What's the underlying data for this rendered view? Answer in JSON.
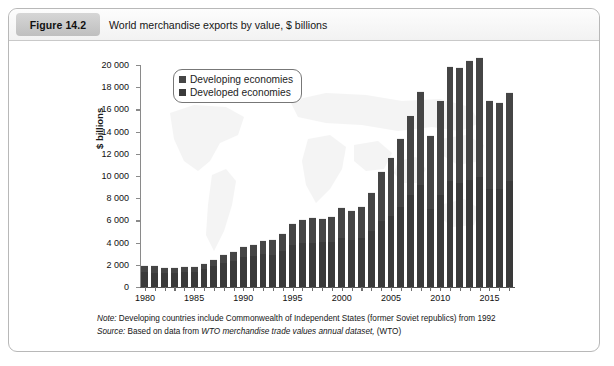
{
  "figure": {
    "badge": "Figure 14.2",
    "title": "World merchandise exports by value, $ billions"
  },
  "notes": {
    "note_key": "Note:",
    "note_text": " Developing countries include Commonwealth of Independent States (former Soviet republics) from 1992",
    "source_key": "Source:",
    "source_pre": " Based on data from ",
    "source_em": "WTO merchandise trade values annual dataset,",
    "source_post": " (WTO)"
  },
  "legend": {
    "position": "top-left-inside",
    "items": [
      {
        "label": "Developing economies",
        "color": "#454545"
      },
      {
        "label": "Developed economies",
        "color": "#3a3a3a"
      }
    ]
  },
  "chart_data": {
    "type": "bar",
    "subtype": "stacked-vertical",
    "title": "World merchandise exports by value, $ billions",
    "xlabel": "",
    "ylabel": "$ billions",
    "ylim": [
      0,
      20000
    ],
    "ytick_step": 2000,
    "ytick_labels": [
      "0",
      "2 000",
      "4 000",
      "6 000",
      "8 000",
      "10 000",
      "12 000",
      "14 000",
      "16 000",
      "18 000",
      "20 000"
    ],
    "grid": false,
    "xtick_labels_shown": [
      "1980",
      "1985",
      "1990",
      "1995",
      "2000",
      "2005",
      "2010",
      "2015"
    ],
    "categories": [
      "1980",
      "1981",
      "1982",
      "1983",
      "1984",
      "1985",
      "1986",
      "1987",
      "1988",
      "1989",
      "1990",
      "1991",
      "1992",
      "1993",
      "1994",
      "1995",
      "1996",
      "1997",
      "1998",
      "1999",
      "2000",
      "2001",
      "2002",
      "2003",
      "2004",
      "2005",
      "2006",
      "2007",
      "2008",
      "2009",
      "2010",
      "2011",
      "2012",
      "2013",
      "2014",
      "2015",
      "2016",
      "2017"
    ],
    "series": [
      {
        "name": "Developed economies",
        "color": "#3a3a3a",
        "values": [
          1320,
          1300,
          1230,
          1230,
          1320,
          1340,
          1600,
          1850,
          2150,
          2330,
          2700,
          2760,
          2950,
          2870,
          3220,
          3810,
          3960,
          4010,
          4060,
          4090,
          4380,
          4210,
          4380,
          5070,
          5960,
          6440,
          7220,
          8280,
          9200,
          7050,
          8330,
          9570,
          9390,
          9670,
          9950,
          8840,
          8870,
          9590
        ]
      },
      {
        "name": "Developing economies",
        "color": "#454545",
        "values": [
          700,
          670,
          570,
          560,
          600,
          570,
          600,
          700,
          830,
          930,
          1030,
          1140,
          1300,
          1420,
          1660,
          1990,
          2140,
          2330,
          2190,
          2350,
          2800,
          2700,
          2950,
          3530,
          4470,
          5300,
          6200,
          7230,
          8430,
          6650,
          8540,
          10350,
          10440,
          10800,
          10770,
          7990,
          7830,
          7950
        ]
      }
    ],
    "totals": [
      2020,
      1970,
      1800,
      1790,
      1920,
      1910,
      2200,
      2550,
      2980,
      3260,
      3730,
      3900,
      4250,
      4290,
      4880,
      5800,
      6100,
      6340,
      6250,
      6440,
      7180,
      6910,
      7330,
      8600,
      10430,
      11740,
      13420,
      15510,
      17630,
      13700,
      16870,
      19920,
      19830,
      20470,
      20720,
      16830,
      16700,
      17540
    ]
  }
}
